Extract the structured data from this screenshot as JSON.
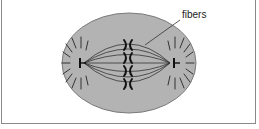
{
  "diagram": {
    "labels": {
      "fibers": "fibers"
    },
    "colors": {
      "cytoplasm": "#b3b3b3",
      "outline": "#7a7a7a",
      "lines": "#333333",
      "chromosome": "#111111"
    },
    "components": [
      "cell",
      "spindle-fibers",
      "chromosomes",
      "left-centriole",
      "right-centriole",
      "asters"
    ]
  }
}
